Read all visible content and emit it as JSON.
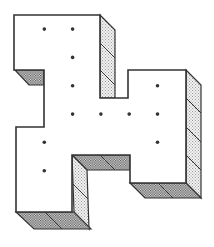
{
  "figure": {
    "grid_unit_label": "unit square",
    "cells": [
      [
        0,
        0
      ],
      [
        1,
        0
      ],
      [
        2,
        0
      ],
      [
        1,
        1
      ],
      [
        2,
        1
      ],
      [
        1,
        2
      ],
      [
        2,
        2
      ],
      [
        5,
        2
      ],
      [
        1,
        3
      ],
      [
        2,
        3
      ],
      [
        3,
        3
      ],
      [
        4,
        3
      ],
      [
        5,
        3
      ],
      [
        0,
        4
      ],
      [
        1,
        4
      ],
      [
        5,
        4
      ],
      [
        0,
        5
      ],
      [
        1,
        5
      ],
      [
        4,
        5
      ],
      [
        5,
        5
      ]
    ],
    "dotted_cells": [
      [
        1,
        0
      ],
      [
        2,
        0
      ],
      [
        2,
        1
      ],
      [
        2,
        2
      ],
      [
        5,
        2
      ],
      [
        2,
        3
      ],
      [
        3,
        3
      ],
      [
        4,
        3
      ],
      [
        5,
        3
      ],
      [
        1,
        4
      ],
      [
        5,
        4
      ],
      [
        1,
        5
      ]
    ],
    "colors": {
      "outline": "#333333",
      "top_face": "#ffffff",
      "side_shading": "#bbbbbb",
      "bottom_shading": "#888888",
      "dot": "#333333"
    }
  }
}
